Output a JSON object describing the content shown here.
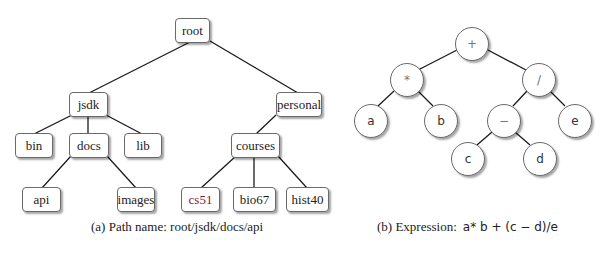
{
  "path_tree": {
    "nodes": {
      "root": "root",
      "jsdk": "jsdk",
      "personal": "personal",
      "bin": "bin",
      "docs": "docs",
      "lib": "lib",
      "courses": "courses",
      "api": "api",
      "images": "images",
      "cs51": "cs51",
      "bio67": "bio67",
      "hist40": "hist40"
    },
    "caption": "(a) Path name: root/jsdk/docs/api"
  },
  "expression_tree": {
    "nodes": {
      "plus": "+",
      "times": "*",
      "divide": "/",
      "a": "a",
      "b": "b",
      "minus": "−",
      "e": "e",
      "c": "c",
      "d": "d"
    },
    "caption_label": "(b) Expression:",
    "caption_expr": "a* b + (c − d)/e"
  }
}
